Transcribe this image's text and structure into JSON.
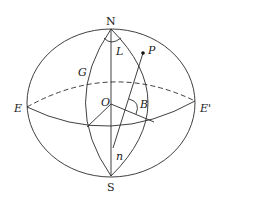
{
  "diagram": {
    "type": "celestial-sphere",
    "labels": {
      "north": "N",
      "south": "S",
      "east": "E",
      "east_prime": "E'",
      "center": "O",
      "point": "P",
      "meridian": "G",
      "angle_L": "L",
      "angle_B": "B",
      "angle_n": "n"
    },
    "colors": {
      "stroke": "#2a2a2a",
      "background": "#ffffff"
    }
  }
}
